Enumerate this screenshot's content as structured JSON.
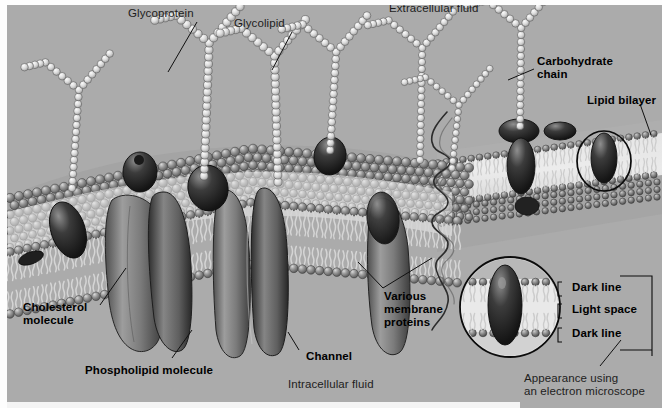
{
  "figure": {
    "background_color": "#a9a9a9",
    "width": 662,
    "height": 408
  },
  "labels": {
    "glycoprotein": "Glycoprotein",
    "glycolipid": "Glycolipid",
    "extracellular_fluid": "Extracellular fluid",
    "carbohydrate_chain": "Carbohydrate\nchain",
    "lipid_bilayer": "Lipid bilayer",
    "cholesterol_molecule": "Cholesterol\nmolecule",
    "phospholipid_molecule": "Phospholipid molecule",
    "channel": "Channel",
    "various_membrane_proteins": "Various\nmembrane\nproteins",
    "intracellular_fluid": "Intracellular fluid",
    "dark_line_top": "Dark line",
    "light_space": "Light space",
    "dark_line_bottom": "Dark line",
    "em_caption": "Appearance using\nan electron microscope"
  },
  "structures": {
    "phospholipid_head_color": "#8d8d8d",
    "phospholipid_tail_color": "#e8e8e8",
    "carbohydrate_bead_color": "#e3e3e3",
    "protein_dark_color": "#3b3b3b",
    "protein_mid_color": "#6f6f6f",
    "cholesterol_color": "#2f2f2f",
    "outline_color": "#101010"
  },
  "em_inset": {
    "shape": "circle",
    "center_x": 510,
    "center_y": 307,
    "radius": 50,
    "layers": [
      "Dark line",
      "Light space",
      "Dark line"
    ]
  },
  "highlight_circle": {
    "shape": "circle",
    "center_x": 604,
    "center_y": 161,
    "radius_x": 27,
    "radius_y": 30
  }
}
